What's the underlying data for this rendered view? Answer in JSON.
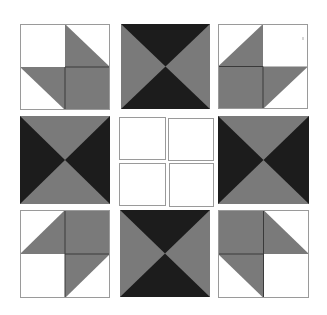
{
  "diagram": {
    "title": "",
    "colors": {
      "background": "#ffffff",
      "dark": "#1c1c1c",
      "medium": "#7a7a7a",
      "light": "#ffffff",
      "outline": "#9a9a9a",
      "seam": "#3a3a3a"
    },
    "grid": {
      "rows": 3,
      "cols": 3
    },
    "blocks": [
      {
        "id": "top-left",
        "type": "corner-pinwheel",
        "row": 0,
        "col": 0
      },
      {
        "id": "top-center",
        "type": "hourglass-dark-vertical",
        "row": 0,
        "col": 1
      },
      {
        "id": "top-right",
        "type": "corner-pinwheel",
        "row": 0,
        "col": 2
      },
      {
        "id": "middle-left",
        "type": "hourglass-dark-horizontal",
        "row": 1,
        "col": 0
      },
      {
        "id": "center",
        "type": "four-patch-plain",
        "row": 1,
        "col": 1
      },
      {
        "id": "middle-right",
        "type": "hourglass-dark-horizontal",
        "row": 1,
        "col": 2
      },
      {
        "id": "bottom-left",
        "type": "corner-pinwheel",
        "row": 2,
        "col": 0
      },
      {
        "id": "bottom-center",
        "type": "hourglass-dark-vertical",
        "row": 2,
        "col": 1
      },
      {
        "id": "bottom-right",
        "type": "corner-pinwheel",
        "row": 2,
        "col": 2
      }
    ]
  }
}
